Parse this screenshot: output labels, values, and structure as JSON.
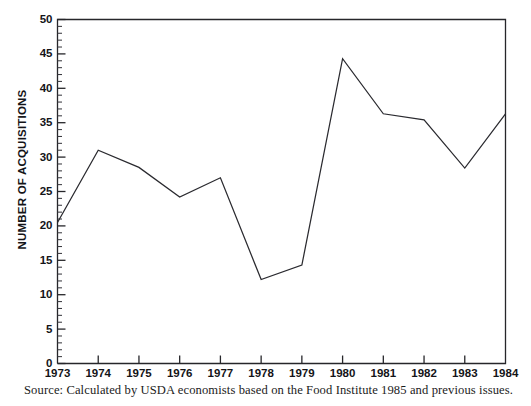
{
  "chart_data": {
    "type": "line",
    "title": "",
    "subtitle": "",
    "xlabel": "",
    "ylabel": "NUMBER OF ACQUISITIONS",
    "x": [
      1973,
      1974,
      1975,
      1976,
      1977,
      1978,
      1979,
      1980,
      1981,
      1982,
      1983,
      1984
    ],
    "categories": [
      "1973",
      "1974",
      "1975",
      "1976",
      "1977",
      "1978",
      "1979",
      "1980",
      "1981",
      "1982",
      "1983",
      "1984"
    ],
    "values": [
      20.5,
      31.0,
      28.5,
      24.2,
      27.0,
      12.2,
      14.3,
      44.3,
      36.3,
      35.4,
      28.4,
      36.3
    ],
    "series": [
      {
        "name": "Number of acquisitions",
        "values": [
          20.5,
          31.0,
          28.5,
          24.2,
          27.0,
          12.2,
          14.3,
          44.3,
          36.3,
          35.4,
          28.4,
          36.3
        ]
      }
    ],
    "xlim": [
      1973,
      1984
    ],
    "ylim": [
      0,
      50
    ],
    "ytick_labels": [
      "0",
      "5",
      "10",
      "15",
      "20",
      "25",
      "30",
      "35",
      "40",
      "45",
      "50"
    ],
    "ytick_values": [
      0,
      5,
      10,
      15,
      20,
      25,
      30,
      35,
      40,
      45,
      50
    ],
    "ytick_minor_step": 1,
    "xtick_labels": [
      "1973",
      "1974",
      "1975",
      "1976",
      "1977",
      "1978",
      "1979",
      "1980",
      "1981",
      "1982",
      "1983",
      "1984"
    ],
    "grid": false,
    "legend": false,
    "legend_position": "none",
    "line_color": "#2a2a2f",
    "background_color": "#ffffff"
  },
  "figure": {
    "source_note": "Source: Calculated by USDA economists based on the Food Institute 1985 and previous issues."
  }
}
